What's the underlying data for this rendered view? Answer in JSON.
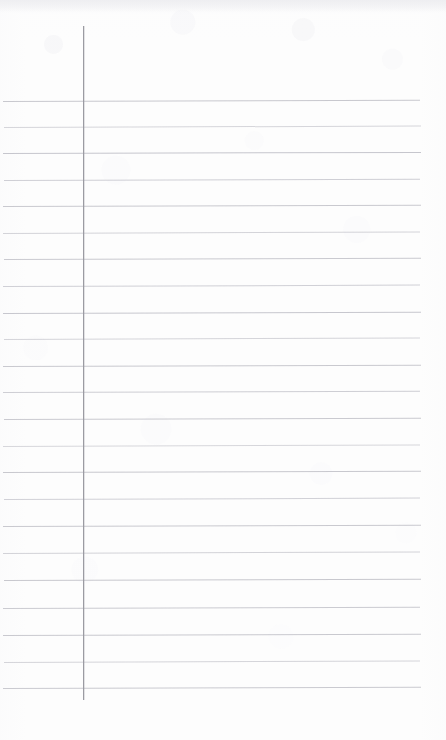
{
  "document": {
    "kind": "scanned-lined-notebook-page",
    "title": "Blank lined notebook page",
    "page_width": 446,
    "page_height": 740,
    "background_color": "#fdfdfd",
    "text_content": "",
    "has_handwriting": false,
    "has_printed_text": false
  },
  "paper": {
    "rule_color": "#c3c3ca",
    "margin_rule_color": "#9b9ba2",
    "edge_shade_color": "#eeeef1",
    "rule_count": 23,
    "rule_thickness_px": 1,
    "first_rule_y": 101,
    "rule_spacing_px": 26.7,
    "rule_left_x": 3,
    "rule_right_x": 421,
    "skew_deg": -0.18,
    "margin_rule_x": 83,
    "margin_rule_top_y": 26,
    "margin_rule_bottom_y": 700
  },
  "rules": [
    {
      "y": 101,
      "left": 3,
      "right": 420,
      "opacity": 0.92,
      "skew": -0.16
    },
    {
      "y": 127,
      "left": 4,
      "right": 421,
      "opacity": 0.68,
      "skew": -0.2
    },
    {
      "y": 153,
      "left": 3,
      "right": 421,
      "opacity": 0.95,
      "skew": -0.15
    },
    {
      "y": 180,
      "left": 4,
      "right": 420,
      "opacity": 0.8,
      "skew": -0.18
    },
    {
      "y": 206,
      "left": 3,
      "right": 421,
      "opacity": 0.9,
      "skew": -0.17
    },
    {
      "y": 233,
      "left": 3,
      "right": 420,
      "opacity": 0.72,
      "skew": -0.2
    },
    {
      "y": 259,
      "left": 4,
      "right": 421,
      "opacity": 0.88,
      "skew": -0.16
    },
    {
      "y": 286,
      "left": 3,
      "right": 420,
      "opacity": 0.78,
      "skew": -0.19
    },
    {
      "y": 313,
      "left": 3,
      "right": 421,
      "opacity": 0.93,
      "skew": -0.16
    },
    {
      "y": 339,
      "left": 4,
      "right": 420,
      "opacity": 0.7,
      "skew": -0.21
    },
    {
      "y": 366,
      "left": 3,
      "right": 421,
      "opacity": 0.9,
      "skew": -0.17
    },
    {
      "y": 392,
      "left": 3,
      "right": 420,
      "opacity": 0.82,
      "skew": -0.18
    },
    {
      "y": 419,
      "left": 4,
      "right": 421,
      "opacity": 0.88,
      "skew": -0.16
    },
    {
      "y": 446,
      "left": 3,
      "right": 420,
      "opacity": 0.66,
      "skew": -0.22
    },
    {
      "y": 472,
      "left": 3,
      "right": 421,
      "opacity": 0.92,
      "skew": -0.16
    },
    {
      "y": 499,
      "left": 4,
      "right": 420,
      "opacity": 0.76,
      "skew": -0.19
    },
    {
      "y": 526,
      "left": 3,
      "right": 421,
      "opacity": 0.9,
      "skew": -0.17
    },
    {
      "y": 553,
      "left": 3,
      "right": 420,
      "opacity": 0.74,
      "skew": -0.2
    },
    {
      "y": 580,
      "left": 4,
      "right": 421,
      "opacity": 0.92,
      "skew": -0.16
    },
    {
      "y": 608,
      "left": 3,
      "right": 420,
      "opacity": 0.86,
      "skew": -0.18
    },
    {
      "y": 635,
      "left": 3,
      "right": 421,
      "opacity": 0.9,
      "skew": -0.16
    },
    {
      "y": 662,
      "left": 4,
      "right": 420,
      "opacity": 0.7,
      "skew": -0.21
    },
    {
      "y": 688,
      "left": 3,
      "right": 421,
      "opacity": 0.88,
      "skew": -0.17
    }
  ]
}
